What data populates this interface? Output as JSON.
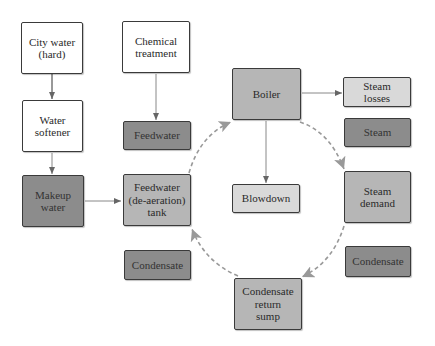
{
  "diagram": {
    "type": "boiler water/steam flow diagram",
    "colors": {
      "input_box": "#ffffff",
      "legend_dark": "#8c8c8c",
      "process_mid": "#b6b6b6",
      "output_light": "#d9d9d9",
      "solid_arrow": "#777777",
      "dashed_arrow": "#999999"
    },
    "nodes": {
      "city_water": "City water\n(hard)",
      "chemical_treatment": "Chemical\ntreatment",
      "water_softener": "Water\nsoftener",
      "feedwater_legend": "Feedwater",
      "makeup_water": "Makeup\nwater",
      "feedwater_tank": "Feedwater\n(de-aeration)\ntank",
      "condensate_legend_left": "Condensate",
      "boiler": "Boiler",
      "steam_losses": "Steam\nlosses",
      "steam_legend": "Steam",
      "blowdown": "Blowdown",
      "steam_demand": "Steam\ndemand",
      "condensate_legend_right": "Condensate",
      "condensate_return_sump": "Condensate\nreturn\nsump"
    },
    "edges": [
      {
        "from": "City water (hard)",
        "to": "Water softener",
        "style": "solid"
      },
      {
        "from": "Water softener",
        "to": "Makeup water",
        "style": "solid"
      },
      {
        "from": "Chemical treatment",
        "to": "Feedwater",
        "style": "solid"
      },
      {
        "from": "Makeup water",
        "to": "Feedwater (de-aeration) tank",
        "style": "solid"
      },
      {
        "from": "Boiler",
        "to": "Steam losses",
        "style": "solid"
      },
      {
        "from": "Boiler",
        "to": "Blowdown",
        "style": "solid"
      },
      {
        "from": "Feedwater (de-aeration) tank",
        "to": "Boiler",
        "style": "dashed"
      },
      {
        "from": "Boiler",
        "to": "Steam demand",
        "style": "dashed"
      },
      {
        "from": "Steam demand",
        "to": "Condensate return sump",
        "style": "dashed"
      },
      {
        "from": "Condensate return sump",
        "to": "Feedwater (de-aeration) tank",
        "style": "dashed"
      }
    ]
  }
}
